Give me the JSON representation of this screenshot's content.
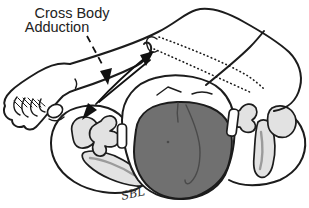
{
  "figure": {
    "type": "anatomical-motion-diagram",
    "label": {
      "line1": "Cross Body",
      "line2": "Adduction"
    },
    "attribution": "SBL",
    "colors": {
      "outline": "#1c1c1c",
      "hair_fill": "#707070",
      "hair_line": "#4a4a4a",
      "bone_fill": "#e2e2e2",
      "bone_shade": "#9b9b9b",
      "arrow": "#111111",
      "background": "#ffffff",
      "text": "#222222"
    }
  }
}
